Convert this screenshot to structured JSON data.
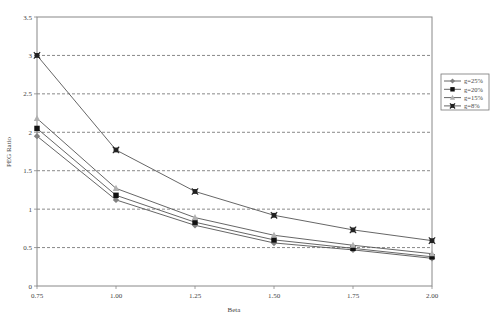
{
  "chart_data": {
    "type": "line",
    "title": "",
    "xlabel": "Beta",
    "ylabel": "PEG Ratio",
    "x": [
      0.75,
      1.0,
      1.25,
      1.5,
      1.75,
      2.0
    ],
    "x_tick_labels": [
      "0.75",
      "1.00",
      "1.25",
      "1.50",
      "1.75",
      "2.00"
    ],
    "y_tick_labels": [
      "0",
      "0.5",
      "1",
      "1.5",
      "2",
      "2.5",
      "3",
      "3.5"
    ],
    "ylim": [
      0,
      3.5
    ],
    "grid": "horizontal dashed",
    "legend_position": "right",
    "series": [
      {
        "name": "g=25%",
        "marker": "diamond",
        "color": "#808080",
        "values": [
          1.95,
          1.12,
          0.79,
          0.56,
          0.47,
          0.36
        ]
      },
      {
        "name": "g=20%",
        "marker": "square",
        "color": "#111111",
        "values": [
          2.05,
          1.18,
          0.83,
          0.6,
          0.49,
          0.38
        ]
      },
      {
        "name": "g=15%",
        "marker": "triangle",
        "color": "#b0b0b0",
        "values": [
          2.18,
          1.27,
          0.89,
          0.66,
          0.53,
          0.42
        ]
      },
      {
        "name": "g=8%",
        "marker": "x-square",
        "color": "#222222",
        "values": [
          3.0,
          1.77,
          1.23,
          0.92,
          0.73,
          0.59
        ]
      }
    ]
  }
}
